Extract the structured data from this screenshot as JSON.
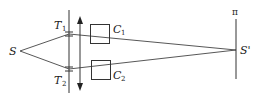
{
  "diagram": {
    "type": "optics-double-slit-setup",
    "labels": {
      "source": "S",
      "image": "S'",
      "screen": "π",
      "slit_top": "T",
      "slit_top_sub": "1",
      "slit_bottom": "T",
      "slit_bottom_sub": "2",
      "cell_top": "C",
      "cell_top_sub": "1",
      "cell_bottom": "C",
      "cell_bottom_sub": "2"
    },
    "colors": {
      "line": "#333333",
      "text": "#222222",
      "background": "#ffffff"
    }
  }
}
